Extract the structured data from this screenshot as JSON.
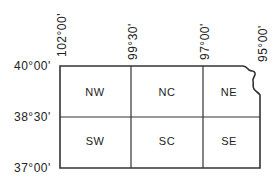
{
  "map": {
    "longitude_labels": [
      "102°00'",
      "99°30'",
      "97°00'",
      "95°00'"
    ],
    "latitude_labels": [
      "40°00'",
      "38°30'",
      "37°00'"
    ],
    "regions": [
      {
        "id": "NW",
        "label": "NW"
      },
      {
        "id": "NC",
        "label": "NC"
      },
      {
        "id": "NE",
        "label": "NE"
      },
      {
        "id": "SW",
        "label": "SW"
      },
      {
        "id": "SC",
        "label": "SC"
      },
      {
        "id": "SE",
        "label": "SE"
      }
    ],
    "line_color": "#333333"
  }
}
